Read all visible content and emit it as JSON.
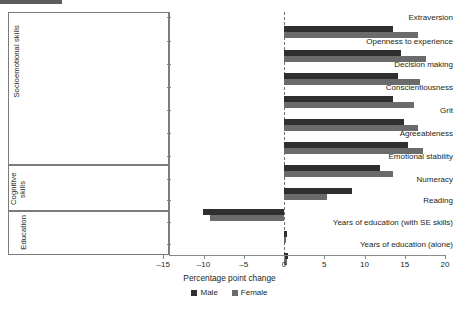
{
  "chart_data": {
    "type": "bar",
    "orientation": "horizontal",
    "title": "",
    "xlabel": "Percentage point change",
    "ylabel": "",
    "xlim": [
      -15,
      20
    ],
    "xticks": [
      -15,
      -10,
      -5,
      0,
      5,
      10,
      15,
      20
    ],
    "xtick_labels": [
      "–15",
      "–10",
      "–5",
      "0",
      "5",
      "10",
      "15",
      "20"
    ],
    "grid": false,
    "zero_reference_line": true,
    "legend_position": "bottom-center",
    "legend": [
      "Male",
      "Female"
    ],
    "categories": [
      "Extraversion",
      "Openness to experience",
      "Decision making",
      "Conscientiousness",
      "Grit",
      "Agreeableness",
      "Emotional stability",
      "Numeracy",
      "Reading",
      "Years of education (with SE skills)",
      "Years of education (alone)"
    ],
    "groups": [
      {
        "label": "Socioemotional skills",
        "categories": [
          "Extraversion",
          "Openness to experience",
          "Decision making",
          "Conscientiousness",
          "Grit",
          "Agreeableness",
          "Emotional stability"
        ]
      },
      {
        "label": "Cognitive skills",
        "categories": [
          "Numeracy",
          "Reading"
        ]
      },
      {
        "label": "Education",
        "categories": [
          "Years of education (with SE skills)",
          "Years of education (alone)"
        ]
      }
    ],
    "series": [
      {
        "name": "Male",
        "color": "#2f2f2f",
        "values": [
          13.5,
          14.5,
          14.2,
          13.5,
          14.9,
          15.4,
          11.9,
          8.5,
          -10.1,
          0.4,
          0.5
        ]
      },
      {
        "name": "Female",
        "color": "#6b6b6b",
        "values": [
          16.7,
          17.7,
          16.9,
          16.1,
          16.6,
          17.3,
          13.6,
          5.4,
          -9.2,
          0.3,
          0.4
        ]
      }
    ]
  },
  "colors": {
    "male": "#2f2f2f",
    "female": "#6b6b6b",
    "axis": "#8a8a8a",
    "frame": "#7a7a7a",
    "text": "#231f20"
  }
}
